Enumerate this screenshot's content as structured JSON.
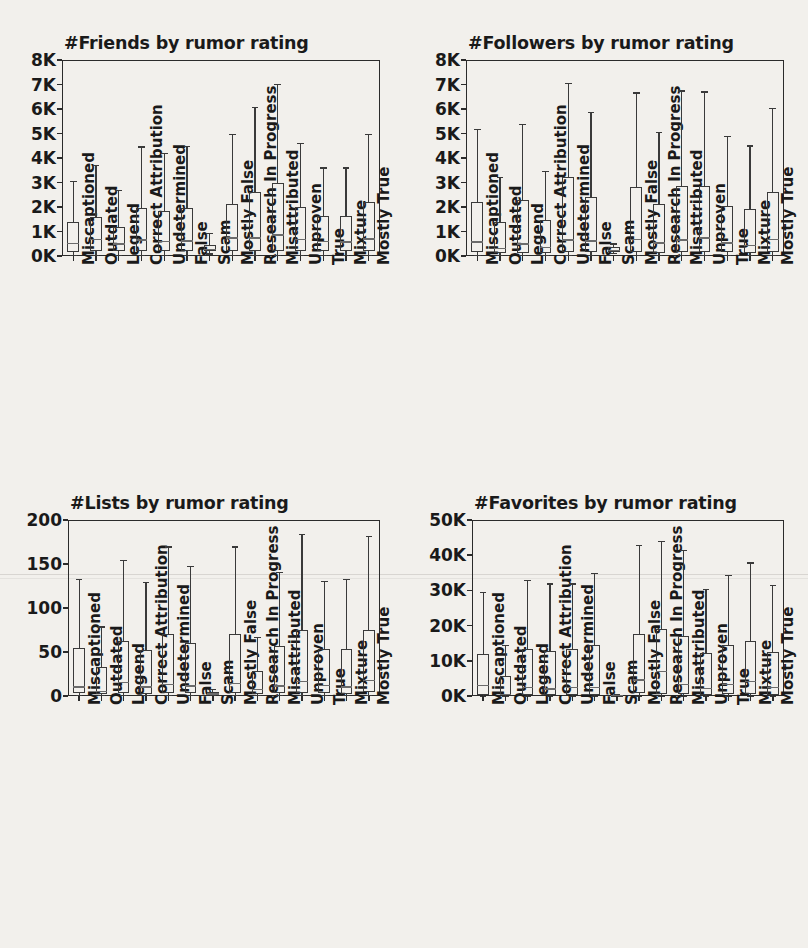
{
  "figure": {
    "background_color": "#f2f0ec",
    "ink_color": "#1a1a1a",
    "categories": [
      "Miscaptioned",
      "Outdated",
      "Legend",
      "Correct Attribution",
      "Undetermined",
      "False",
      "Scam",
      "Mostly False",
      "Research In Progress",
      "Misattributed",
      "Unproven",
      "True",
      "Mixture",
      "Mostly True"
    ]
  },
  "chart_data": [
    {
      "type": "box",
      "id": "friends",
      "title": "#Friends by rumor rating",
      "xlabel": "",
      "ylabel": "",
      "ylim": [
        0,
        8000
      ],
      "yticks": [
        0,
        1000,
        2000,
        3000,
        4000,
        5000,
        6000,
        7000,
        8000
      ],
      "ytick_labels": [
        "0K",
        "1K",
        "2K",
        "3K",
        "4K",
        "5K",
        "6K",
        "7K",
        "8K"
      ],
      "grid": false,
      "legend": "none",
      "categories": [
        "Miscaptioned",
        "Outdated",
        "Legend",
        "Correct Attribution",
        "Undetermined",
        "False",
        "Scam",
        "Mostly False",
        "Research In Progress",
        "Misattributed",
        "Unproven",
        "True",
        "Mixture",
        "Mostly True"
      ],
      "boxes": [
        {
          "category": "Miscaptioned",
          "whisker_low": 60,
          "q1": 170,
          "median": 540,
          "q3": 1400,
          "whisker_high": 3060
        },
        {
          "category": "Outdated",
          "whisker_low": 60,
          "q1": 210,
          "median": 700,
          "q3": 1610,
          "whisker_high": 3720
        },
        {
          "category": "Legend",
          "whisker_low": 50,
          "q1": 190,
          "median": 520,
          "q3": 1180,
          "whisker_high": 2700
        },
        {
          "category": "Correct Attribution",
          "whisker_low": 60,
          "q1": 200,
          "median": 680,
          "q3": 1940,
          "whisker_high": 4480
        },
        {
          "category": "Undetermined",
          "whisker_low": 60,
          "q1": 190,
          "median": 620,
          "q3": 1840,
          "whisker_high": 4200
        },
        {
          "category": "False",
          "whisker_low": 60,
          "q1": 190,
          "median": 640,
          "q3": 1960,
          "whisker_high": 4500
        },
        {
          "category": "Scam",
          "whisker_low": 110,
          "q1": 190,
          "median": 290,
          "q3": 440,
          "whisker_high": 950
        },
        {
          "category": "Mostly False",
          "whisker_low": 60,
          "q1": 200,
          "median": 760,
          "q3": 2140,
          "whisker_high": 4980
        },
        {
          "category": "Research In Progress",
          "whisker_low": 60,
          "q1": 190,
          "median": 760,
          "q3": 2620,
          "whisker_high": 6100
        },
        {
          "category": "Misattributed",
          "whisker_low": 60,
          "q1": 190,
          "median": 880,
          "q3": 2960,
          "whisker_high": 7020
        },
        {
          "category": "Unproven",
          "whisker_low": 60,
          "q1": 210,
          "median": 700,
          "q3": 2000,
          "whisker_high": 4620
        },
        {
          "category": "True",
          "whisker_low": 60,
          "q1": 200,
          "median": 620,
          "q3": 1620,
          "whisker_high": 3620
        },
        {
          "category": "Mixture",
          "whisker_low": 60,
          "q1": 200,
          "median": 600,
          "q3": 1620,
          "whisker_high": 3620
        },
        {
          "category": "Mostly True",
          "whisker_low": 60,
          "q1": 210,
          "median": 720,
          "q3": 2200,
          "whisker_high": 5000
        }
      ]
    },
    {
      "type": "box",
      "id": "followers",
      "title": "#Followers by rumor rating",
      "xlabel": "",
      "ylabel": "",
      "ylim": [
        0,
        8000
      ],
      "yticks": [
        0,
        1000,
        2000,
        3000,
        4000,
        5000,
        6000,
        7000,
        8000
      ],
      "ytick_labels": [
        "0K",
        "1K",
        "2K",
        "3K",
        "4K",
        "5K",
        "6K",
        "7K",
        "8K"
      ],
      "grid": false,
      "legend": "none",
      "categories": [
        "Miscaptioned",
        "Outdated",
        "Legend",
        "Correct Attribution",
        "Undetermined",
        "False",
        "Scam",
        "Mostly False",
        "Research In Progress",
        "Misattributed",
        "Unproven",
        "True",
        "Mixture",
        "Mostly True"
      ],
      "boxes": [
        {
          "category": "Miscaptioned",
          "whisker_low": 40,
          "q1": 150,
          "median": 600,
          "q3": 2220,
          "whisker_high": 5180
        },
        {
          "category": "Outdated",
          "whisker_low": 40,
          "q1": 120,
          "median": 330,
          "q3": 1400,
          "whisker_high": 3240
        },
        {
          "category": "Legend",
          "whisker_low": 40,
          "q1": 140,
          "median": 520,
          "q3": 2300,
          "whisker_high": 5400
        },
        {
          "category": "Correct Attribution",
          "whisker_low": 40,
          "q1": 110,
          "median": 380,
          "q3": 1480,
          "whisker_high": 3480
        },
        {
          "category": "Undetermined",
          "whisker_low": 40,
          "q1": 150,
          "median": 680,
          "q3": 3240,
          "whisker_high": 7080
        },
        {
          "category": "False",
          "whisker_low": 40,
          "q1": 150,
          "median": 640,
          "q3": 2420,
          "whisker_high": 5880
        },
        {
          "category": "Scam",
          "whisker_low": 120,
          "q1": 170,
          "median": 260,
          "q3": 360,
          "whisker_high": 520
        },
        {
          "category": "Mostly False",
          "whisker_low": 40,
          "q1": 150,
          "median": 700,
          "q3": 2820,
          "whisker_high": 6680
        },
        {
          "category": "Research In Progress",
          "whisker_low": 40,
          "q1": 140,
          "median": 560,
          "q3": 2120,
          "whisker_high": 5080
        },
        {
          "category": "Misattributed",
          "whisker_low": 40,
          "q1": 150,
          "median": 680,
          "q3": 2840,
          "whisker_high": 6760
        },
        {
          "category": "Unproven",
          "whisker_low": 40,
          "q1": 150,
          "median": 760,
          "q3": 2840,
          "whisker_high": 6720
        },
        {
          "category": "True",
          "whisker_low": 40,
          "q1": 150,
          "median": 560,
          "q3": 2060,
          "whisker_high": 4900
        },
        {
          "category": "Mixture",
          "whisker_low": 40,
          "q1": 130,
          "median": 450,
          "q3": 1920,
          "whisker_high": 4520
        },
        {
          "category": "Mostly True",
          "whisker_low": 40,
          "q1": 160,
          "median": 700,
          "q3": 2620,
          "whisker_high": 6040
        }
      ]
    },
    {
      "type": "box",
      "id": "lists",
      "title": "#Lists by rumor rating",
      "xlabel": "",
      "ylabel": "",
      "ylim": [
        0,
        200
      ],
      "yticks": [
        0,
        50,
        100,
        150,
        200
      ],
      "ytick_labels": [
        "0",
        "50",
        "100",
        "150",
        "200"
      ],
      "grid": false,
      "legend": "none",
      "categories": [
        "Miscaptioned",
        "Outdated",
        "Legend",
        "Correct Attribution",
        "Undetermined",
        "False",
        "Scam",
        "Mostly False",
        "Research In Progress",
        "Misattributed",
        "Unproven",
        "True",
        "Mixture",
        "Mostly True"
      ],
      "boxes": [
        {
          "category": "Miscaptioned",
          "whisker_low": 1,
          "q1": 3,
          "median": 11,
          "q3": 54,
          "whisker_high": 133
        },
        {
          "category": "Outdated",
          "whisker_low": 1,
          "q1": 2,
          "median": 6,
          "q3": 33,
          "whisker_high": 79
        },
        {
          "category": "Legend",
          "whisker_low": 1,
          "q1": 3,
          "median": 16,
          "q3": 63,
          "whisker_high": 155
        },
        {
          "category": "Correct Attribution",
          "whisker_low": 1,
          "q1": 2,
          "median": 11,
          "q3": 52,
          "whisker_high": 130
        },
        {
          "category": "Undetermined",
          "whisker_low": 1,
          "q1": 3,
          "median": 14,
          "q3": 70,
          "whisker_high": 170
        },
        {
          "category": "False",
          "whisker_low": 1,
          "q1": 3,
          "median": 12,
          "q3": 60,
          "whisker_high": 148
        },
        {
          "category": "Scam",
          "whisker_low": 1,
          "q1": 2,
          "median": 3,
          "q3": 5,
          "whisker_high": 8
        },
        {
          "category": "Mostly False",
          "whisker_low": 1,
          "q1": 3,
          "median": 15,
          "q3": 70,
          "whisker_high": 170
        },
        {
          "category": "Research In Progress",
          "whisker_low": 1,
          "q1": 2,
          "median": 8,
          "q3": 28,
          "whisker_high": 67
        },
        {
          "category": "Misattributed",
          "whisker_low": 1,
          "q1": 3,
          "median": 12,
          "q3": 57,
          "whisker_high": 141
        },
        {
          "category": "Unproven",
          "whisker_low": 1,
          "q1": 3,
          "median": 17,
          "q3": 75,
          "whisker_high": 184
        },
        {
          "category": "True",
          "whisker_low": 1,
          "q1": 3,
          "median": 13,
          "q3": 53,
          "whisker_high": 131
        },
        {
          "category": "Mixture",
          "whisker_low": 1,
          "q1": 2,
          "median": 11,
          "q3": 53,
          "whisker_high": 133
        },
        {
          "category": "Mostly True",
          "whisker_low": 1,
          "q1": 4,
          "median": 18,
          "q3": 75,
          "whisker_high": 182
        }
      ]
    },
    {
      "type": "box",
      "id": "favorites",
      "title": "#Favorites by rumor rating",
      "xlabel": "",
      "ylabel": "",
      "ylim": [
        0,
        50000
      ],
      "yticks": [
        0,
        10000,
        20000,
        30000,
        40000,
        50000
      ],
      "ytick_labels": [
        "0K",
        "10K",
        "20K",
        "30K",
        "40K",
        "50K"
      ],
      "grid": false,
      "legend": "none",
      "categories": [
        "Miscaptioned",
        "Outdated",
        "Legend",
        "Correct Attribution",
        "Undetermined",
        "False",
        "Scam",
        "Mostly False",
        "Research In Progress",
        "Misattributed",
        "Unproven",
        "True",
        "Mixture",
        "Mostly True"
      ],
      "boxes": [
        {
          "category": "Miscaptioned",
          "whisker_low": 100,
          "q1": 400,
          "median": 3200,
          "q3": 12000,
          "whisker_high": 29500
        },
        {
          "category": "Outdated",
          "whisker_low": 100,
          "q1": 200,
          "median": 500,
          "q3": 5700,
          "whisker_high": 14500
        },
        {
          "category": "Legend",
          "whisker_low": 100,
          "q1": 400,
          "median": 2600,
          "q3": 13300,
          "whisker_high": 33000
        },
        {
          "category": "Correct Attribution",
          "whisker_low": 100,
          "q1": 300,
          "median": 2200,
          "q3": 12800,
          "whisker_high": 32000
        },
        {
          "category": "Undetermined",
          "whisker_low": 100,
          "q1": 400,
          "median": 2600,
          "q3": 13300,
          "whisker_high": 32000
        },
        {
          "category": "False",
          "whisker_low": 100,
          "q1": 400,
          "median": 2500,
          "q3": 14500,
          "whisker_high": 35000
        },
        {
          "category": "Scam",
          "whisker_low": 100,
          "q1": 150,
          "median": 250,
          "q3": 400,
          "whisker_high": 700
        },
        {
          "category": "Mostly False",
          "whisker_low": 100,
          "q1": 900,
          "median": 4700,
          "q3": 17500,
          "whisker_high": 43000
        },
        {
          "category": "Research In Progress",
          "whisker_low": 100,
          "q1": 700,
          "median": 7100,
          "q3": 19000,
          "whisker_high": 44000
        },
        {
          "category": "Misattributed",
          "whisker_low": 100,
          "q1": 500,
          "median": 3500,
          "q3": 17000,
          "whisker_high": 41500
        },
        {
          "category": "Unproven",
          "whisker_low": 100,
          "q1": 400,
          "median": 2400,
          "q3": 12200,
          "whisker_high": 30500
        },
        {
          "category": "True",
          "whisker_low": 100,
          "q1": 500,
          "median": 3500,
          "q3": 14400,
          "whisker_high": 34500
        },
        {
          "category": "Mixture",
          "whisker_low": 100,
          "q1": 500,
          "median": 4300,
          "q3": 15500,
          "whisker_high": 38000
        },
        {
          "category": "Mostly True",
          "whisker_low": 100,
          "q1": 400,
          "median": 2500,
          "q3": 12500,
          "whisker_high": 31500
        }
      ]
    }
  ]
}
